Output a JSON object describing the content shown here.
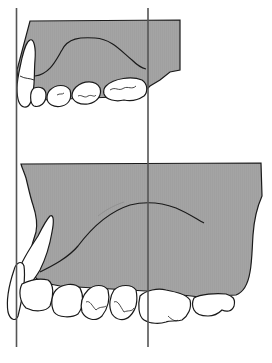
{
  "figure": {
    "type": "dental-jaw-diagram",
    "width": 272,
    "height": 363,
    "colors": {
      "background": "#ffffff",
      "bone_fill": "#a4a4a4",
      "outline": "#1a1a1a",
      "reference_line": "#555555",
      "tooth_fill": "#ffffff"
    },
    "reference_lines": [
      {
        "name": "anterior-reference-line",
        "x": 16.5,
        "y1": 8,
        "y2": 347
      },
      {
        "name": "posterior-reference-line",
        "x": 148,
        "y1": 8,
        "y2": 347
      }
    ],
    "jaws": [
      {
        "name": "upper-jaw-small",
        "top": 20,
        "right": 180
      },
      {
        "name": "lower-jaw-large",
        "top": 163,
        "right": 261
      }
    ]
  }
}
